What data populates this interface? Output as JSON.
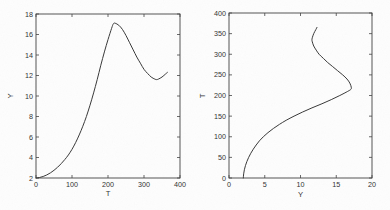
{
  "figure": {
    "background_color": "#fdfdfd",
    "line_color": "#3a3a3a",
    "axis_color": "#444444",
    "panel_count": 2
  },
  "chart_data": [
    {
      "type": "line",
      "panel": "left",
      "title": "",
      "xlabel": "T",
      "ylabel": "Y",
      "xlim": [
        0,
        400
      ],
      "ylim": [
        2,
        18
      ],
      "xticks": [
        0,
        100,
        200,
        300,
        400
      ],
      "xticklabels": [
        "0",
        "100",
        "200",
        "300",
        "400"
      ],
      "yticks": [
        2,
        4,
        6,
        8,
        10,
        12,
        14,
        16,
        18
      ],
      "yticklabels": [
        "2",
        "4",
        "6",
        "8",
        "10",
        "12",
        "14",
        "16",
        "18"
      ],
      "grid": false,
      "legend": null,
      "series": [
        {
          "name": "Y(T)",
          "x": [
            0,
            10,
            20,
            30,
            40,
            50,
            60,
            70,
            80,
            90,
            100,
            110,
            120,
            130,
            140,
            150,
            160,
            170,
            180,
            190,
            200,
            210,
            215,
            220,
            230,
            240,
            250,
            260,
            270,
            280,
            290,
            300,
            310,
            320,
            330,
            335,
            340,
            350,
            360,
            365
          ],
          "y": [
            2.0,
            2.05,
            2.15,
            2.3,
            2.5,
            2.75,
            3.05,
            3.4,
            3.8,
            4.25,
            4.8,
            5.45,
            6.2,
            7.05,
            8.0,
            9.1,
            10.3,
            11.6,
            13.0,
            14.3,
            15.5,
            16.6,
            17.05,
            17.1,
            16.9,
            16.5,
            15.9,
            15.2,
            14.5,
            13.8,
            13.2,
            12.6,
            12.2,
            11.85,
            11.65,
            11.6,
            11.65,
            11.85,
            12.15,
            12.3
          ]
        }
      ]
    },
    {
      "type": "line",
      "panel": "right",
      "title": "",
      "xlabel": "Y",
      "ylabel": "T",
      "xlim": [
        0,
        20
      ],
      "ylim": [
        0,
        400
      ],
      "xticks": [
        0,
        5,
        10,
        15,
        20
      ],
      "xticklabels": [
        "0",
        "5",
        "10",
        "15",
        "20"
      ],
      "yticks": [
        0,
        50,
        100,
        150,
        200,
        250,
        300,
        350,
        400
      ],
      "yticklabels": [
        "0",
        "50",
        "100",
        "150",
        "200",
        "250",
        "300",
        "350",
        "400"
      ],
      "grid": false,
      "legend": null,
      "series": [
        {
          "name": "T(Y)",
          "x": [
            2.0,
            2.05,
            2.15,
            2.3,
            2.5,
            2.75,
            3.05,
            3.4,
            3.8,
            4.25,
            4.8,
            5.45,
            6.2,
            7.05,
            8.0,
            9.1,
            10.3,
            11.6,
            13.0,
            14.3,
            15.5,
            16.6,
            17.05,
            17.1,
            16.9,
            16.5,
            15.9,
            15.2,
            14.5,
            13.8,
            13.2,
            12.6,
            12.2,
            11.85,
            11.65,
            11.6,
            11.65,
            11.85,
            12.15,
            12.3
          ],
          "y": [
            0,
            10,
            20,
            30,
            40,
            50,
            60,
            70,
            80,
            90,
            100,
            110,
            120,
            130,
            140,
            150,
            160,
            170,
            180,
            190,
            200,
            210,
            215,
            220,
            230,
            240,
            250,
            260,
            270,
            280,
            290,
            300,
            310,
            320,
            330,
            335,
            340,
            350,
            360,
            365
          ]
        }
      ]
    }
  ]
}
